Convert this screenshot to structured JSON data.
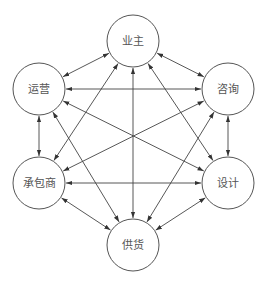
{
  "diagram": {
    "type": "complete-graph",
    "directionality": "bidirectional",
    "colors": {
      "line": "#444444",
      "node_stroke": "#555555",
      "text": "#555555",
      "background": "#ffffff"
    },
    "node_radius": 26,
    "nodes": [
      {
        "id": "owner",
        "label": "业主",
        "x": 133,
        "y": 41
      },
      {
        "id": "operation",
        "label": "运营",
        "x": 39,
        "y": 89
      },
      {
        "id": "consulting",
        "label": "咨询",
        "x": 228,
        "y": 89
      },
      {
        "id": "contractor",
        "label": "承包商",
        "x": 39,
        "y": 183
      },
      {
        "id": "design",
        "label": "设计",
        "x": 228,
        "y": 183
      },
      {
        "id": "supply",
        "label": "供货",
        "x": 133,
        "y": 245
      }
    ],
    "edges": [
      [
        "owner",
        "operation"
      ],
      [
        "owner",
        "consulting"
      ],
      [
        "owner",
        "contractor"
      ],
      [
        "owner",
        "design"
      ],
      [
        "owner",
        "supply"
      ],
      [
        "operation",
        "consulting"
      ],
      [
        "operation",
        "contractor"
      ],
      [
        "operation",
        "design"
      ],
      [
        "operation",
        "supply"
      ],
      [
        "consulting",
        "contractor"
      ],
      [
        "consulting",
        "design"
      ],
      [
        "consulting",
        "supply"
      ],
      [
        "contractor",
        "design"
      ],
      [
        "contractor",
        "supply"
      ],
      [
        "design",
        "supply"
      ]
    ]
  }
}
